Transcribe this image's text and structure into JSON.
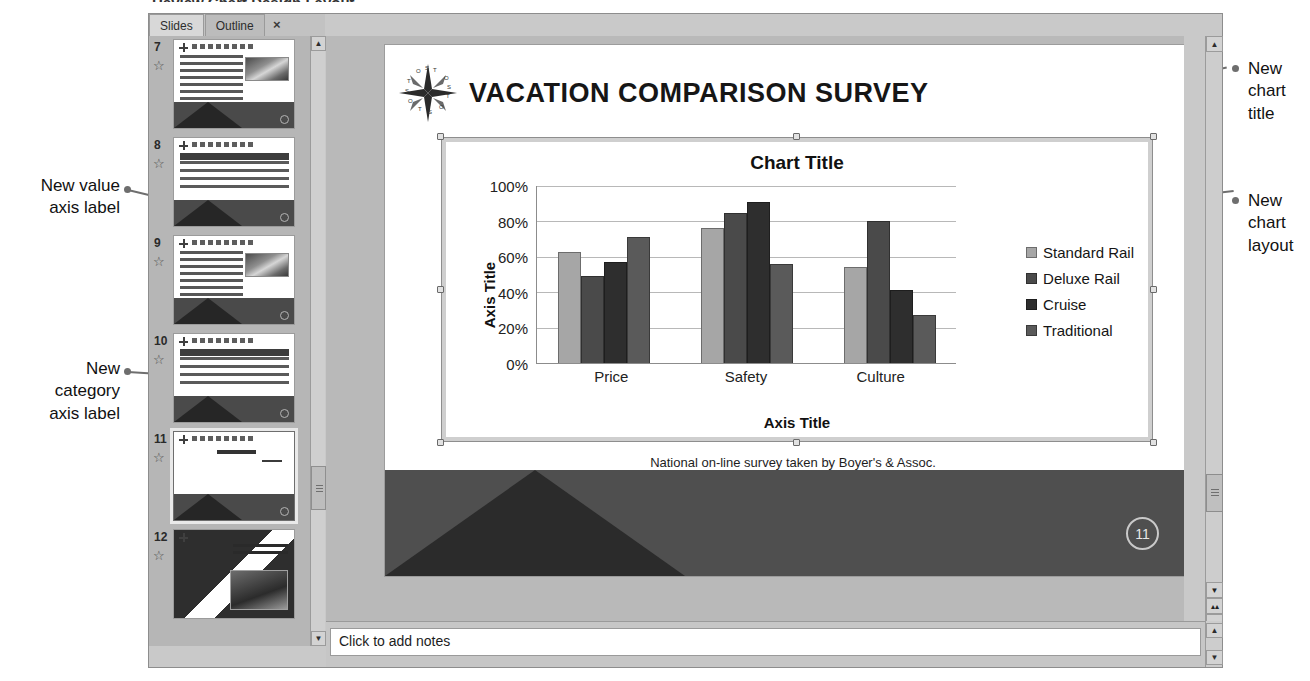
{
  "window": {
    "tabs": [
      {
        "label": "Slides",
        "active": true
      },
      {
        "label": "Outline",
        "active": false
      }
    ],
    "close_label": "×",
    "clipped_heading": "Review Chart Design Layout"
  },
  "slides_panel": {
    "thumbnails": [
      {
        "number": "7",
        "kind": "bullets-image",
        "selected": false,
        "star": "☆"
      },
      {
        "number": "8",
        "kind": "table",
        "selected": false,
        "star": "☆"
      },
      {
        "number": "9",
        "kind": "bullets-image",
        "selected": false,
        "star": "☆"
      },
      {
        "number": "10",
        "kind": "table",
        "selected": false,
        "star": "☆"
      },
      {
        "number": "11",
        "kind": "chart",
        "selected": true,
        "star": "☆"
      },
      {
        "number": "12",
        "kind": "closing",
        "selected": false,
        "star": "☆"
      }
    ]
  },
  "slide": {
    "title": "VACATION COMPARISON SURVEY",
    "caption": "National on-line survey taken by Boyer's & Assoc.",
    "slide_number": "11",
    "logo_letters": [
      "O",
      "S",
      "T",
      "O",
      "S",
      "T",
      "O",
      "S",
      "T",
      "O",
      "S",
      "T"
    ]
  },
  "chart_data": {
    "type": "bar",
    "title": "Chart Title",
    "xlabel": "Axis Title",
    "ylabel": "Axis Title",
    "categories": [
      "Price",
      "Safety",
      "Culture"
    ],
    "series": [
      {
        "name": "Standard Rail",
        "color": "#a6a6a6",
        "values": [
          63,
          76,
          54
        ]
      },
      {
        "name": "Deluxe Rail",
        "color": "#4a4a4a",
        "values": [
          49,
          85,
          80
        ]
      },
      {
        "name": "Cruise",
        "color": "#2e2e2e",
        "values": [
          57,
          91,
          41
        ]
      },
      {
        "name": "Traditional",
        "color": "#5a5a5a",
        "values": [
          71,
          56,
          27
        ]
      }
    ],
    "ylim": [
      0,
      100
    ],
    "yticks": [
      "0%",
      "20%",
      "40%",
      "60%",
      "80%",
      "100%"
    ],
    "ytick_values": [
      0,
      20,
      40,
      60,
      80,
      100
    ],
    "grid": true,
    "legend_position": "right"
  },
  "notes": {
    "placeholder": "Click to add notes"
  },
  "scrollbars": {
    "up_arrow": "▲",
    "down_arrow": "▼",
    "prev_slide": "▲",
    "next_slide": "▼",
    "double_up": "▴▴",
    "double_down": "▾▾"
  },
  "callouts": [
    {
      "id": "new-value-axis-label",
      "lines": [
        "New value",
        "axis label"
      ]
    },
    {
      "id": "new-category-axis-label",
      "lines": [
        "New",
        "category",
        "axis label"
      ]
    },
    {
      "id": "new-chart-title",
      "lines": [
        "New",
        "chart",
        "title"
      ]
    },
    {
      "id": "new-chart-layout",
      "lines": [
        "New",
        "chart",
        "layout"
      ]
    }
  ]
}
